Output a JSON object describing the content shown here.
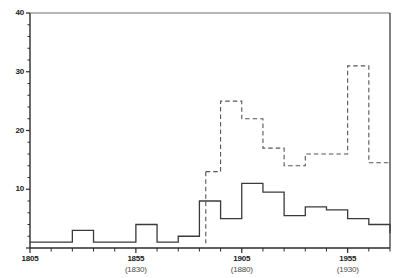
{
  "chart_data": {
    "type": "line",
    "title": "",
    "subtitle": "",
    "xlabel": "",
    "ylabel": "",
    "xlim": [
      1805,
      1975
    ],
    "ylim": [
      0,
      40
    ],
    "grid": false,
    "legend_position": "none",
    "x_major_ticks": [
      1805,
      1855,
      1905,
      1955
    ],
    "x_major_tick_labels": [
      "1805",
      "1855",
      "1905",
      "1955"
    ],
    "x_major_tick_sublabels": [
      "",
      "(1830)",
      "(1880)",
      "(1930)"
    ],
    "x_minor_tick_step": 10,
    "y_major_ticks": [
      0,
      10,
      20,
      30,
      40
    ],
    "y_major_tick_labels": [
      "",
      "10",
      "20",
      "30",
      "40"
    ],
    "y_minor_tick_step": 2,
    "series": [
      {
        "name": "solid-step-series",
        "style": "solid",
        "color": "#3a3a3a",
        "drawstyle": "steps-post",
        "x": [
          1805,
          1815,
          1825,
          1835,
          1845,
          1855,
          1865,
          1875,
          1885,
          1895,
          1905,
          1915,
          1925,
          1935,
          1945,
          1955,
          1965,
          1975
        ],
        "values": [
          1,
          1,
          3,
          1,
          1,
          4,
          1,
          2,
          8,
          5,
          11,
          9.5,
          5.5,
          7,
          6.5,
          5,
          4,
          2.5
        ]
      },
      {
        "name": "dashed-step-series",
        "style": "dashed",
        "color": "#555555",
        "drawstyle": "steps-post",
        "x": [
          1888,
          1895,
          1905,
          1915,
          1925,
          1935,
          1955,
          1965,
          1975
        ],
        "values": [
          13,
          25,
          22,
          17,
          14,
          16,
          31,
          14.5,
          14.5
        ]
      }
    ]
  },
  "axes": {
    "y_labels": [
      "40",
      "30",
      "20",
      "10"
    ],
    "x_labels": [
      "1805",
      "1855",
      "1905",
      "1955"
    ],
    "x_sublabels": [
      "",
      "(1830)",
      "(1880)",
      "(1930)"
    ]
  }
}
